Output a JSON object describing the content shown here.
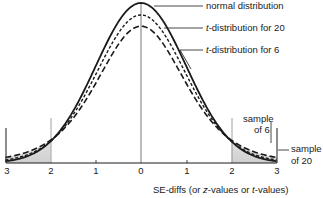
{
  "chart_data": {
    "type": "line",
    "title": "",
    "xlabel": "SE-diffs (or z-values or t-values)",
    "ylabel": "",
    "xlim": [
      -3,
      3
    ],
    "grid": false,
    "x_tick_labels": [
      "3",
      "2",
      "1",
      "0",
      "1",
      "2",
      "3"
    ],
    "x_ticks": [
      -3,
      -2,
      -1,
      0,
      1,
      2,
      3
    ],
    "series": [
      {
        "name": "normal distribution",
        "style": "solid",
        "peak_relative": 1.0
      },
      {
        "name": "t-distribution for 20",
        "style": "short-dashed",
        "df": 20,
        "peak_relative": 0.92
      },
      {
        "name": "t-distribution for 6",
        "style": "long-dashed",
        "df": 6,
        "peak_relative": 0.86
      }
    ],
    "shaded_regions": [
      {
        "from": -3,
        "to": -2,
        "label": "tail"
      },
      {
        "from": 2,
        "to": 3,
        "label": "tail"
      }
    ],
    "annotations": [
      "sample of 6",
      "sample of 20"
    ]
  },
  "legend": {
    "normal": "normal distribution",
    "t20_italic": "t",
    "t20_rest": "-distribution for 20",
    "t6_italic": "t",
    "t6_rest": "-distribution for 6"
  },
  "annotations": {
    "sample6_line1": "sample",
    "sample6_line2": "of 6",
    "sample20_line1": "sample",
    "sample20_line2": "of 20"
  },
  "axis": {
    "ticks": [
      "3",
      "2",
      "1",
      "0",
      "1",
      "2",
      "3"
    ],
    "xlabel_a": "SE-diffs (or ",
    "xlabel_z": "z",
    "xlabel_b": "-values or ",
    "xlabel_t": "t",
    "xlabel_c": "-values)"
  }
}
